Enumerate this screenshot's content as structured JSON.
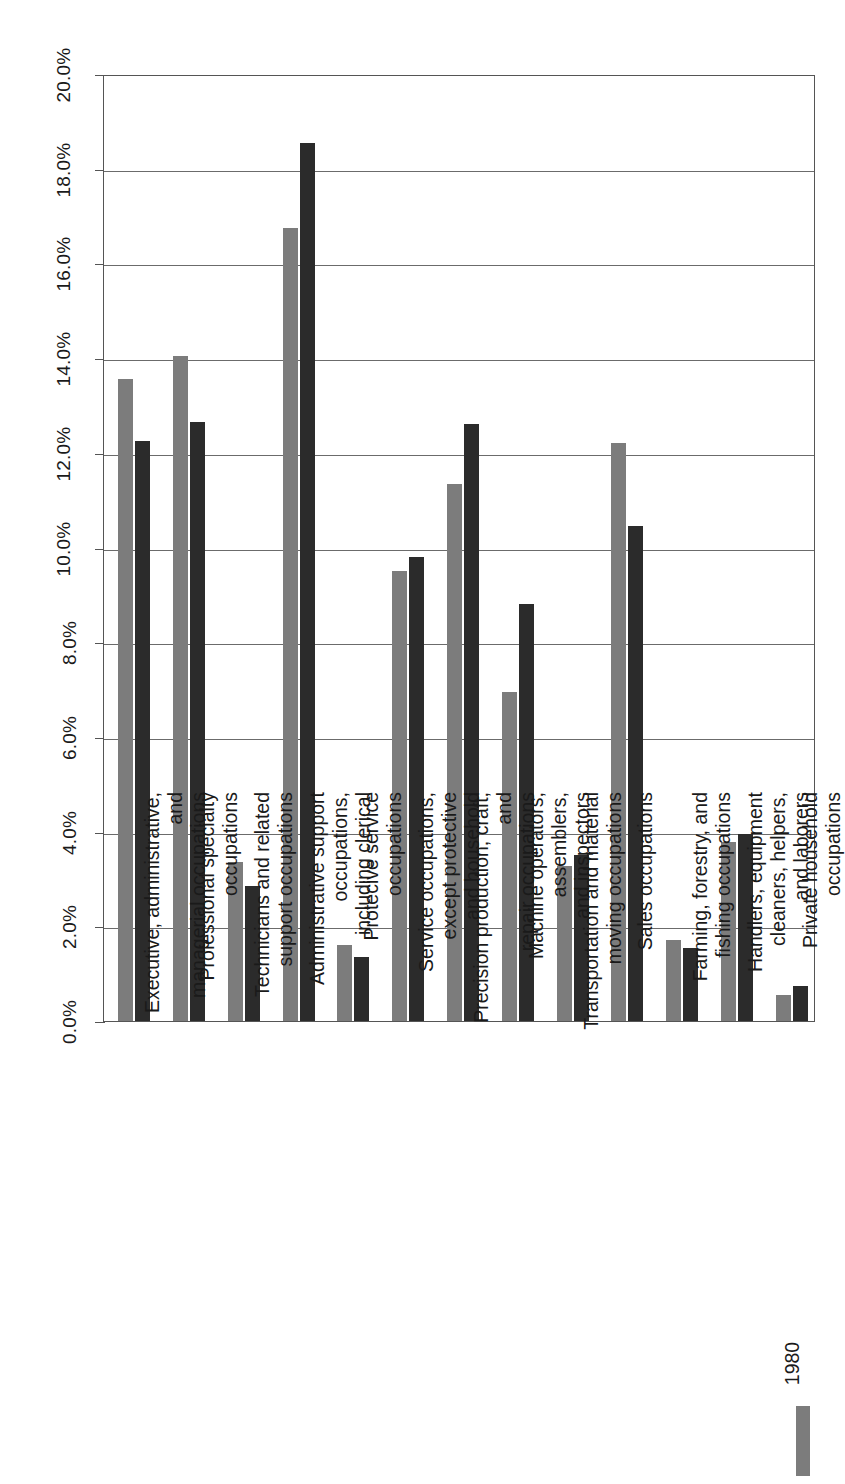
{
  "chart_data": {
    "type": "bar",
    "title": "",
    "subtitle": "",
    "xlabel": "",
    "ylabel": "",
    "orientation": "vertical-bars-rotated-page",
    "grid": true,
    "legend_position": "bottom-right",
    "ylim": [
      0.0,
      20.0
    ],
    "y_unit": "%",
    "yticks": [
      "0.0%",
      "2.0%",
      "4.0%",
      "6.0%",
      "8.0%",
      "10.0%",
      "12.0%",
      "14.0%",
      "16.0%",
      "18.0%",
      "20.0%"
    ],
    "ytick_values": [
      0.0,
      2.0,
      4.0,
      6.0,
      8.0,
      10.0,
      12.0,
      14.0,
      16.0,
      18.0,
      20.0
    ],
    "categories": [
      "Executive, administrative, and\nmanagerial occupations",
      "Professional specialty occupations",
      "Technicians and related support occupations",
      "Administrative support occupations,\nincluding clerical",
      "Protecive service occupations",
      "Service occupations, except protective\nand household",
      "Precision production, craft, and\nrepair occupations",
      "Machine operators, assemblers,\nand inspectors",
      "Transportation and material\nmoving occupations",
      "Sales occupations",
      "Farming, forestry, and fishing occupations",
      "Handlers, equipment cleaners, helpers,\nand laborers",
      "Private household occupations"
    ],
    "series": [
      {
        "name": "1980",
        "color": "#7c7c7c",
        "values": [
          13.55,
          14.05,
          3.35,
          16.75,
          1.6,
          9.5,
          11.35,
          6.95,
          3.28,
          12.2,
          1.72,
          3.78,
          0.55
        ]
      },
      {
        "name": "",
        "color": "#2b2b2b",
        "values": [
          12.25,
          12.65,
          2.85,
          18.55,
          1.35,
          9.8,
          12.6,
          8.8,
          3.5,
          10.45,
          1.55,
          3.95,
          0.75
        ]
      }
    ]
  },
  "axis": {
    "tick_labels": [
      "0.0%",
      "2.0%",
      "4.0%",
      "6.0%",
      "8.0%",
      "10.0%",
      "12.0%",
      "14.0%",
      "16.0%",
      "18.0%",
      "20.0%"
    ]
  },
  "categories": [
    "Executive, administrative, and\nmanagerial occupations",
    "Professional specialty occupations",
    "Technicians and related support occupations",
    "Administrative support occupations,\nincluding clerical",
    "Protecive service occupations",
    "Service occupations, except protective\nand household",
    "Precision production, craft, and\nrepair occupations",
    "Machine operators, assemblers,\nand inspectors",
    "Transportation and material\nmoving occupations",
    "Sales occupations",
    "Farming, forestry, and fishing occupations",
    "Handlers, equipment cleaners, helpers,\nand laborers",
    "Private household occupations"
  ],
  "legend": {
    "label": "1980",
    "swatch_color": "#7c7c7c"
  },
  "colors": {
    "series1": "#7c7c7c",
    "series2": "#2b2b2b",
    "grid": "#6b6b6b",
    "frame": "#555555",
    "text": "#1a1a1a"
  }
}
